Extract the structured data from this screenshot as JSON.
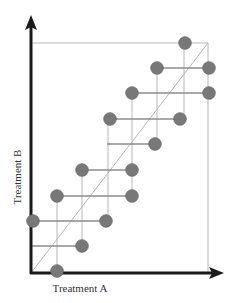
{
  "chart_data": {
    "type": "scatter",
    "title": "",
    "xlabel": "Treatment A",
    "ylabel": "Treatment B",
    "grid": false,
    "legend": null,
    "axis_origin_px": [
      31,
      273
    ],
    "top_right_px": [
      208,
      43
    ],
    "points": [
      {
        "x": 185,
        "y": 43
      },
      {
        "x": 157,
        "y": 68
      },
      {
        "x": 209,
        "y": 68
      },
      {
        "x": 132,
        "y": 93
      },
      {
        "x": 209,
        "y": 93
      },
      {
        "x": 110,
        "y": 119
      },
      {
        "x": 180,
        "y": 119
      },
      {
        "x": 155,
        "y": 144
      },
      {
        "x": 82,
        "y": 170
      },
      {
        "x": 132,
        "y": 170
      },
      {
        "x": 57,
        "y": 196
      },
      {
        "x": 132,
        "y": 196
      },
      {
        "x": 33,
        "y": 221
      },
      {
        "x": 106,
        "y": 221
      },
      {
        "x": 82,
        "y": 246
      },
      {
        "x": 57,
        "y": 271
      }
    ],
    "horizontal_segments": [
      {
        "y": 43,
        "x1": 31,
        "x2": 208
      },
      {
        "y": 68,
        "x1": 157,
        "x2": 209
      },
      {
        "y": 93,
        "x1": 132,
        "x2": 209
      },
      {
        "y": 119,
        "x1": 110,
        "x2": 180
      },
      {
        "y": 144,
        "x1": 107,
        "x2": 155
      },
      {
        "y": 170,
        "x1": 82,
        "x2": 132
      },
      {
        "y": 196,
        "x1": 57,
        "x2": 132
      },
      {
        "y": 221,
        "x1": 33,
        "x2": 106
      },
      {
        "y": 246,
        "x1": 31,
        "x2": 82
      }
    ],
    "vertical_segments": [
      {
        "x": 208,
        "y1": 43,
        "y2": 273
      },
      {
        "x": 184,
        "y1": 43,
        "y2": 119
      },
      {
        "x": 157,
        "y1": 68,
        "y2": 144
      },
      {
        "x": 132,
        "y1": 93,
        "y2": 196
      },
      {
        "x": 108,
        "y1": 119,
        "y2": 221
      },
      {
        "x": 82,
        "y1": 170,
        "y2": 246
      },
      {
        "x": 57,
        "y1": 196,
        "y2": 271
      }
    ],
    "diagonal": {
      "x1": 31,
      "y1": 273,
      "x2": 208,
      "y2": 43
    }
  },
  "colors": {
    "point": "#787878",
    "point_stroke": "#6a6a6a",
    "segment": "#8c8c8c",
    "guide": "#b8b8b8",
    "axis": "#1a1a1a"
  }
}
